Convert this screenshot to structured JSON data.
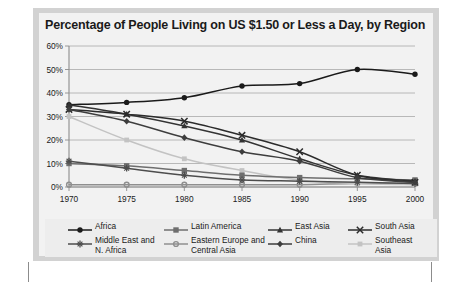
{
  "chart_data": {
    "type": "line",
    "title": "Percentage of People Living on US $1.50 or Less a Day, by Region",
    "xlabel": "",
    "ylabel": "",
    "x": [
      1970,
      1975,
      1980,
      1985,
      1990,
      1995,
      2000
    ],
    "categories": [
      "1970",
      "1975",
      "1980",
      "1985",
      "1990",
      "1995",
      "2000"
    ],
    "xlim": [
      1970,
      2000
    ],
    "ylim": [
      0,
      60
    ],
    "yticks": [
      0,
      10,
      20,
      30,
      40,
      50,
      60
    ],
    "ytick_labels": [
      "0%",
      "10%",
      "20%",
      "30%",
      "40%",
      "50%",
      "60%"
    ],
    "grid": true,
    "legend_position": "bottom",
    "series": [
      {
        "name": "Africa",
        "marker": "circle",
        "color": "#1a1a1a",
        "values": [
          35,
          36,
          38,
          43,
          44,
          50,
          48
        ]
      },
      {
        "name": "Latin America",
        "marker": "square",
        "color": "#6e6e6e",
        "values": [
          10,
          9,
          7,
          5,
          4,
          3.5,
          3
        ]
      },
      {
        "name": "East Asia",
        "marker": "triangle",
        "color": "#333333",
        "values": [
          35,
          31,
          26,
          20,
          12,
          5,
          2.5
        ]
      },
      {
        "name": "South Asia",
        "marker": "cross",
        "color": "#2b2b2b",
        "values": [
          33,
          31,
          28,
          22,
          15,
          5,
          2
        ]
      },
      {
        "name": "Middle East and\nN. Africa",
        "marker": "asterisk",
        "color": "#4d4d4d",
        "values": [
          11,
          8,
          5,
          3,
          2.5,
          2,
          1.5
        ]
      },
      {
        "name": "Eastern Europe and\nCentral Asia",
        "marker": "circle-open",
        "color": "#8f8f8f",
        "values": [
          1,
          1,
          1,
          1,
          1,
          1.5,
          1.5
        ]
      },
      {
        "name": "China",
        "marker": "diamond",
        "color": "#3d3d3d",
        "values": [
          33,
          28,
          21,
          15,
          11,
          4,
          2
        ]
      },
      {
        "name": "Southeast\nAsia",
        "marker": "square-light",
        "color": "#c3c3c3",
        "values": [
          30,
          20,
          12,
          7,
          3,
          1.5,
          1
        ]
      }
    ]
  },
  "legend": {
    "items": [
      {
        "label": "Africa"
      },
      {
        "label": "Latin America"
      },
      {
        "label": "East Asia"
      },
      {
        "label": "South Asia"
      },
      {
        "label": "Middle East and\nN. Africa"
      },
      {
        "label": "Eastern Europe and\nCentral Asia"
      },
      {
        "label": "China"
      },
      {
        "label": "Southeast\nAsia"
      }
    ]
  },
  "colors": {
    "plate": "#d2d2d2",
    "card": "#f2f2f2",
    "grid": "#a8a8a8",
    "axis": "#8c8c8c",
    "text": "#1a1a1a"
  }
}
